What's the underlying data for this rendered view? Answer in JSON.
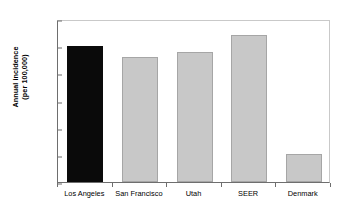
{
  "chart_data": {
    "type": "bar",
    "title": "",
    "xlabel": "",
    "ylabel_line1": "Annual incidence",
    "ylabel_line2": "(per 100,000)",
    "ylabel": "Annual incidence (per 100,000)",
    "categories": [
      "Los Angeles",
      "San Francisco",
      "Utah",
      "SEER",
      "Denmark"
    ],
    "values": [
      2.51,
      2.3,
      2.4,
      2.7,
      0.51
    ],
    "bar_colors": [
      "#0a0a0a",
      "#c8c8c8",
      "#c8c8c8",
      "#c8c8c8",
      "#c8c8c8"
    ],
    "highlight_category": "Los Angeles",
    "ylim": [
      0.0,
      3.0
    ],
    "ytick_values": [
      0.0,
      0.5,
      1.0,
      1.5,
      2.0,
      2.5,
      3.0
    ],
    "ytick_labels": [
      "0.0",
      "0.5",
      "1.0",
      "1.5",
      "2.0",
      "2.5",
      "3.0"
    ],
    "grid": false,
    "legend": null,
    "frame": true
  },
  "colors": {
    "axis": "#6e6e6e",
    "frame_light": "#c9c9c9",
    "bar_gray": "#c8c8c8",
    "bar_gray_edge": "#a6a6a6",
    "bar_black": "#0a0a0a",
    "text": "#000000",
    "background": "#ffffff"
  }
}
